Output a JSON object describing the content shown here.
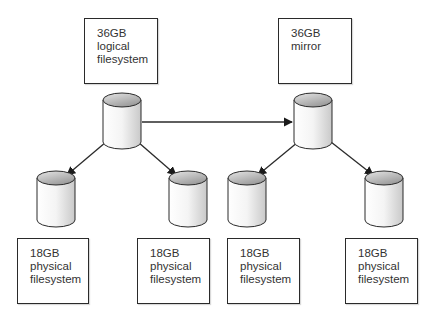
{
  "diagram": {
    "title": "",
    "nodes": {
      "logical": {
        "lines": [
          "36GB",
          "logical",
          "filesystem"
        ]
      },
      "mirror": {
        "lines": [
          "36GB",
          "mirror"
        ]
      },
      "phys1": {
        "lines": [
          "18GB",
          "physical",
          "filesystem"
        ]
      },
      "phys2": {
        "lines": [
          "18GB",
          "physical",
          "filesystem"
        ]
      },
      "phys3": {
        "lines": [
          "18GB",
          "physical",
          "filesystem"
        ]
      },
      "phys4": {
        "lines": [
          "18GB",
          "physical",
          "filesystem"
        ]
      }
    },
    "edges": [
      {
        "from": "logical-disk",
        "to": "mirror-disk"
      },
      {
        "from": "logical-disk",
        "to": "phys1-disk"
      },
      {
        "from": "logical-disk",
        "to": "phys2-disk"
      },
      {
        "from": "mirror-disk",
        "to": "phys3-disk"
      },
      {
        "from": "mirror-disk",
        "to": "phys4-disk"
      }
    ],
    "colors": {
      "stroke": "#2a2a2a",
      "text": "#333333",
      "cylinder_top": "#bdbdbd",
      "cylinder_body": "#f2f2f2"
    }
  }
}
